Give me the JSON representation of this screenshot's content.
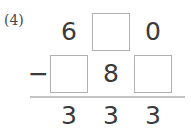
{
  "problem": {
    "index_label": "(4)",
    "operator": "−",
    "operation": "subtraction",
    "columns": [
      "hundreds",
      "tens",
      "ones"
    ],
    "rows": {
      "minuend": {
        "name": "minuend-row",
        "cells": [
          {
            "type": "digit",
            "value": "6"
          },
          {
            "type": "blank",
            "value": ""
          },
          {
            "type": "digit",
            "value": "0"
          }
        ]
      },
      "subtrahend": {
        "name": "subtrahend-row",
        "cells": [
          {
            "type": "blank",
            "value": ""
          },
          {
            "type": "digit",
            "value": "8"
          },
          {
            "type": "blank",
            "value": ""
          }
        ]
      },
      "difference": {
        "name": "difference-row",
        "cells": [
          {
            "type": "digit",
            "value": "3"
          },
          {
            "type": "digit",
            "value": "3"
          },
          {
            "type": "digit",
            "value": "3"
          }
        ]
      }
    }
  },
  "colors": {
    "background": "#ffffff",
    "digit": "#3a3a3a",
    "blank_border": "#b0b0b0",
    "rule": "#c4c4c4",
    "index_label": "#4a4a4a"
  }
}
